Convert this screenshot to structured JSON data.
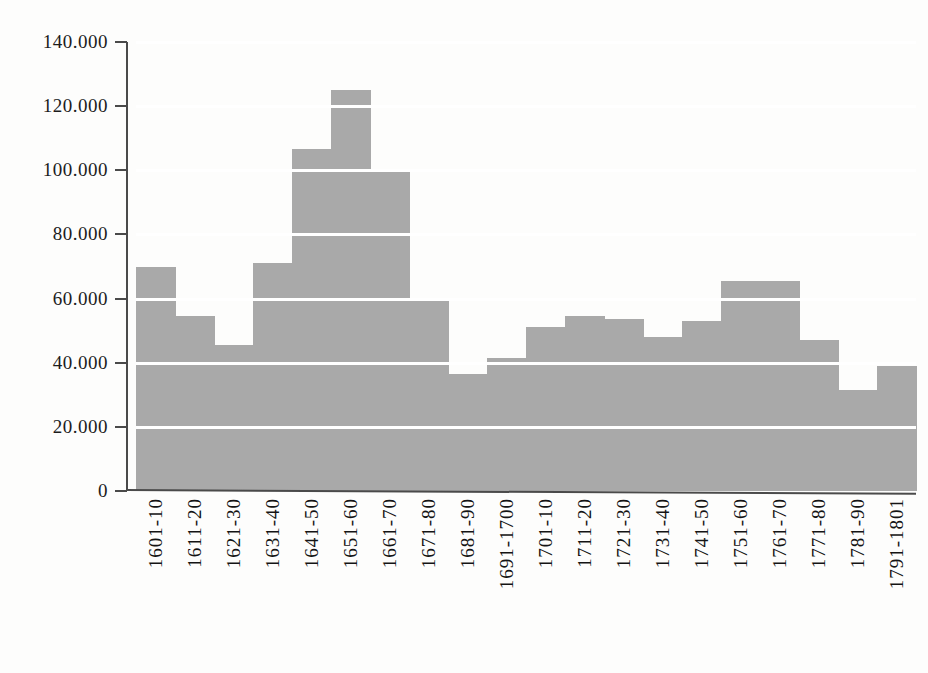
{
  "chart_data": {
    "type": "bar",
    "title": "",
    "subtitle": "",
    "xlabel": "",
    "ylabel": "",
    "orientation": "vertical",
    "grid": "horizontal-white-gridlines-over-bars",
    "legend": "none",
    "bar_color": "#a9a9a9",
    "axis_color": "#4a4a4a",
    "gridline_color": "#ffffff",
    "ylim": [
      0,
      140000
    ],
    "ytick_interval": 20000,
    "ytick_labels": [
      "0",
      "20.000",
      "40.000",
      "60.000",
      "80.000",
      "100.000",
      "120.000",
      "140.000"
    ],
    "ytick_values": [
      0,
      20000,
      40000,
      60000,
      80000,
      100000,
      120000,
      140000
    ],
    "xtick_rotation_deg": 90,
    "categories": [
      "1601-10",
      "1611-20",
      "1621-30",
      "1631-40",
      "1641-50",
      "1651-60",
      "1661-70",
      "1671-80",
      "1681-90",
      "1691-1700",
      "1701-10",
      "1711-20",
      "1721-30",
      "1731-40",
      "1741-50",
      "1751-60",
      "1761-70",
      "1771-80",
      "1781-90",
      "1791-1801"
    ],
    "values": [
      70000,
      54500,
      45500,
      71000,
      106500,
      125000,
      100000,
      59500,
      36500,
      41500,
      51000,
      54500,
      53500,
      48000,
      53000,
      65500,
      65500,
      47000,
      31500,
      39000
    ]
  }
}
